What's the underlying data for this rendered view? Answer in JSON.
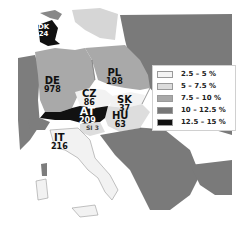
{
  "map": {
    "type": "choropleth",
    "region": "Central Europe",
    "legend": [
      {
        "label": "2.5 – 5 %",
        "color": "#f4f4f4"
      },
      {
        "label": "5 – 7.5 %",
        "color": "#dcdcdc"
      },
      {
        "label": "7.5 – 10 %",
        "color": "#a8a8a8"
      },
      {
        "label": "10 – 12.5 %",
        "color": "#777777"
      },
      {
        "label": "12.5 – 15 %",
        "color": "#111111"
      }
    ],
    "countries": [
      {
        "code": "DK",
        "value": "24",
        "class": "12.5 – 15 %"
      },
      {
        "code": "DE",
        "value": "978",
        "class": "7.5 – 10 %"
      },
      {
        "code": "PL",
        "value": "198",
        "class": "7.5 – 10 %"
      },
      {
        "code": "CZ",
        "value": "86",
        "class": "2.5 – 5 %"
      },
      {
        "code": "SK",
        "value": "37",
        "class": "2.5 – 5 %"
      },
      {
        "code": "AT",
        "value": "209",
        "class": "12.5 – 15 %"
      },
      {
        "code": "HU",
        "value": "63",
        "class": "5 – 7.5 %"
      },
      {
        "code": "SI",
        "value": "3",
        "class": "5 – 7.5 %"
      },
      {
        "code": "IT",
        "value": "216",
        "class": "2.5 – 5 %"
      }
    ]
  }
}
